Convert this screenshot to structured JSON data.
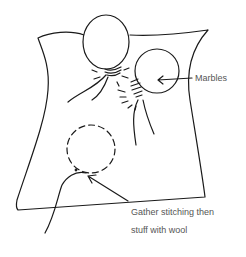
{
  "diagram": {
    "labels": {
      "marbles": "Marbles",
      "gather_line1": "Gather stitching then",
      "gather_line2": "stuff with wool"
    },
    "colors": {
      "ink": "#1a1a1a",
      "text": "#555555",
      "background": "#ffffff"
    }
  }
}
